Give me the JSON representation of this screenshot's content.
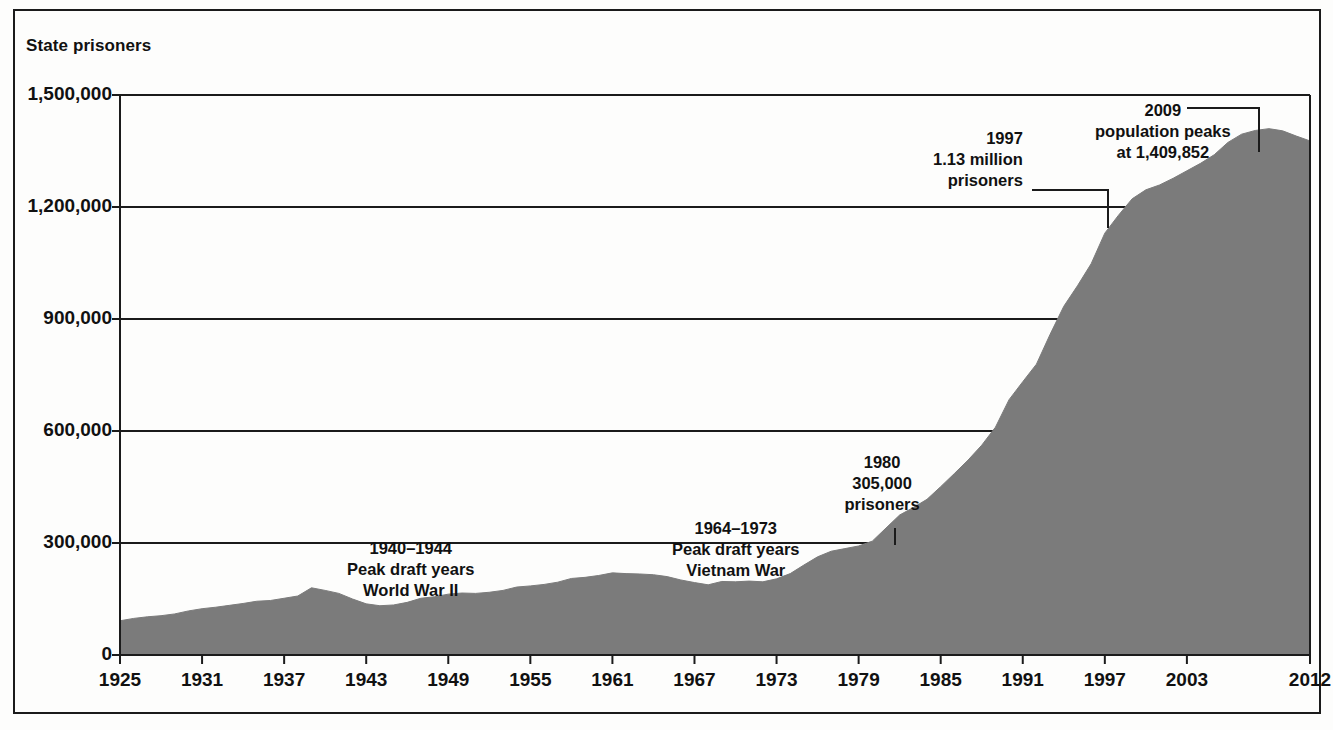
{
  "figure": {
    "y_axis_title": "State prisoners"
  },
  "chart_data": {
    "type": "area",
    "title": "",
    "subtitle": "",
    "xlabel": "",
    "ylabel": "State prisoners",
    "grid": true,
    "legend": "none",
    "series_color": "#7b7b7b",
    "axis_color": "#1b1b1b",
    "xlim": [
      1925,
      2012
    ],
    "ylim": [
      0,
      1500000
    ],
    "x_tick_labels": [
      "1925",
      "1931",
      "1937",
      "1943",
      "1949",
      "1955",
      "1961",
      "1967",
      "1973",
      "1979",
      "1985",
      "1991",
      "1997",
      "2003",
      "2012"
    ],
    "x_tick_values": [
      1925,
      1931,
      1937,
      1943,
      1949,
      1955,
      1961,
      1967,
      1973,
      1979,
      1985,
      1991,
      1997,
      2003,
      2012
    ],
    "y_tick_labels": [
      "0",
      "300,000",
      "600,000",
      "900,000",
      "1,200,000",
      "1,500,000"
    ],
    "y_tick_values": [
      0,
      300000,
      600000,
      900000,
      1200000,
      1500000
    ],
    "x": [
      1925,
      1926,
      1927,
      1928,
      1929,
      1930,
      1931,
      1932,
      1933,
      1934,
      1935,
      1936,
      1937,
      1938,
      1939,
      1940,
      1941,
      1942,
      1943,
      1944,
      1945,
      1946,
      1947,
      1948,
      1949,
      1950,
      1951,
      1952,
      1953,
      1954,
      1955,
      1956,
      1957,
      1958,
      1959,
      1960,
      1961,
      1962,
      1963,
      1964,
      1965,
      1966,
      1967,
      1968,
      1969,
      1970,
      1971,
      1972,
      1973,
      1974,
      1975,
      1976,
      1977,
      1978,
      1979,
      1980,
      1981,
      1982,
      1983,
      1984,
      1985,
      1986,
      1987,
      1988,
      1989,
      1990,
      1991,
      1992,
      1993,
      1994,
      1995,
      1996,
      1997,
      1998,
      1999,
      2000,
      2001,
      2002,
      2003,
      2004,
      2005,
      2006,
      2007,
      2008,
      2009,
      2010,
      2011,
      2012
    ],
    "values": [
      91669,
      97991,
      102321,
      105271,
      110000,
      118000,
      124000,
      128000,
      133000,
      138000,
      144000,
      146000,
      152000,
      158000,
      180000,
      173000,
      165000,
      150000,
      137000,
      132000,
      134000,
      141000,
      152000,
      156000,
      163000,
      166000,
      165000,
      168000,
      173000,
      182000,
      185000,
      189000,
      195000,
      205000,
      208000,
      213000,
      220000,
      218000,
      217000,
      215000,
      210000,
      201000,
      194000,
      188000,
      197000,
      196000,
      198000,
      196000,
      204000,
      218000,
      241000,
      263000,
      278000,
      285000,
      292000,
      305000,
      340000,
      375000,
      395000,
      417000,
      451000,
      486000,
      522000,
      562000,
      610000,
      684000,
      732000,
      779000,
      859000,
      934000,
      989000,
      1048000,
      1130000,
      1178000,
      1222000,
      1246000,
      1259000,
      1277000,
      1297000,
      1317000,
      1340000,
      1373000,
      1395000,
      1405000,
      1409852,
      1404000,
      1390000,
      1377000
    ],
    "annotations": [
      {
        "id": "wwii",
        "lines": [
          "1940–1944",
          "Peak draft years",
          "World War II"
        ],
        "align": "center",
        "x_px": 411,
        "y_px": 538,
        "leader": null
      },
      {
        "id": "vietnam",
        "lines": [
          "1964–1973",
          "Peak draft years",
          "Vietnam War"
        ],
        "align": "center",
        "x_px": 736,
        "y_px": 518,
        "leader": null
      },
      {
        "id": "1980",
        "lines": [
          "1980",
          "305,000",
          "prisoners"
        ],
        "align": "center",
        "x_px": 882,
        "y_px": 452,
        "leader": {
          "type": "vertical-drop",
          "x1": 895,
          "y1": 528,
          "x2": 895,
          "y2": 545
        }
      },
      {
        "id": "1997",
        "lines": [
          "1997",
          "1.13 million",
          "prisoners"
        ],
        "align": "right",
        "x_px": 1023,
        "y_px": 128,
        "leader": {
          "type": "elbow-right-down",
          "x1": 1032,
          "y1": 190,
          "x2": 1108,
          "y2": 190,
          "x3": 1108,
          "y3": 228
        }
      },
      {
        "id": "2009",
        "lines": [
          "2009",
          "population peaks",
          "at 1,409,852"
        ],
        "align": "center",
        "x_px": 1163,
        "y_px": 100,
        "leader": {
          "type": "elbow-right-down",
          "x1": 1187,
          "y1": 108,
          "x2": 1259,
          "y2": 108,
          "x3": 1259,
          "y3": 152
        }
      }
    ]
  }
}
